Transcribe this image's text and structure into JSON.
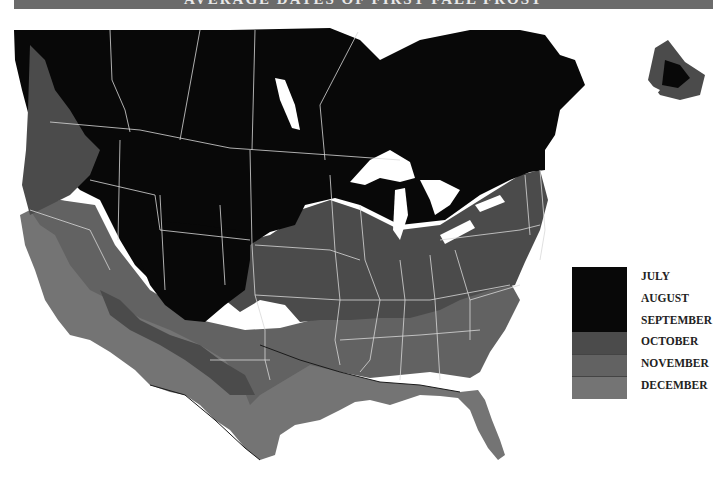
{
  "title": "AVERAGE DATES OF FIRST FALL FROST",
  "colors": {
    "title_bar": "#6b6b6b",
    "july_aug_sep": "#080808",
    "october": "#4b4b4b",
    "november": "#626262",
    "december": "#747474",
    "water": "#ffffff",
    "borders": "#d8d8d8",
    "contour": "#1a1a1a"
  },
  "legend": {
    "items": [
      {
        "label": "JULY",
        "color": "#080808"
      },
      {
        "label": "AUGUST",
        "color": "#080808"
      },
      {
        "label": "SEPTEMBER",
        "color": "#080808"
      },
      {
        "label": "OCTOBER",
        "color": "#4b4b4b"
      },
      {
        "label": "NOVEMBER",
        "color": "#626262"
      },
      {
        "label": "DECEMBER",
        "color": "#747474"
      }
    ]
  },
  "map": {
    "region": "North America (USA and southern Canada)",
    "zones": [
      "July–September (north, mountains)",
      "October (central plains, midwest, northeast)",
      "November (south-central, southeast)",
      "December (Gulf coast, Florida, southwest, Pacific coast)"
    ]
  }
}
